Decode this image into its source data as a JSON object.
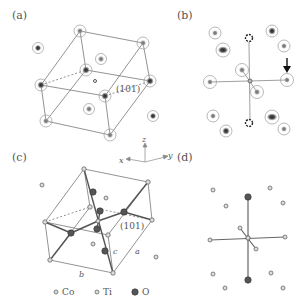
{
  "figure": {
    "panels": [
      {
        "id": "a",
        "label": "(a)",
        "plane_label": "(101)"
      },
      {
        "id": "b",
        "label": "(b)"
      },
      {
        "id": "c",
        "label": "(c)",
        "plane_label": "(101)",
        "lattice_labels": {
          "a": "a",
          "b": "b",
          "c": "c"
        }
      },
      {
        "id": "d",
        "label": "(d)"
      }
    ],
    "axes": {
      "x": "x",
      "y": "y",
      "z": "z"
    },
    "legend": [
      {
        "symbol": "small-atom",
        "label": "Co"
      },
      {
        "symbol": "small-atom",
        "label": "Ti"
      },
      {
        "symbol": "large-dark-atom",
        "label": "O"
      }
    ],
    "colors": {
      "line": "#6a6a6a",
      "dark_atom": "#3a3a3a",
      "ring": "#8a8a8a",
      "text": "#555555"
    }
  }
}
